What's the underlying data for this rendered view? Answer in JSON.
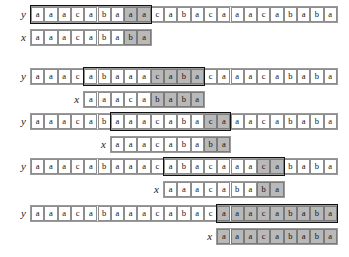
{
  "figure": {
    "kind": "string-matching-alignment-trace",
    "text_label": "y",
    "pattern_label": "x",
    "text": "aaacabaaacabacaaacababa",
    "pattern": "aaacababa",
    "text_length": 23,
    "pattern_length": 9,
    "cell_width_px": 13.3,
    "colors": {
      "shade": "#b9b9b9",
      "cell_border": "#8d8d8d",
      "window_border": "#111111",
      "strip_border": "#9a9a9a",
      "text": "#111111",
      "background": "#ffffff"
    }
  },
  "steps": [
    {
      "id": "step-1",
      "top": 6,
      "text_row": {
        "label": "y",
        "chars": [
          "a",
          "a",
          "a",
          "c",
          "a",
          "b",
          "a",
          "a",
          "a",
          "c",
          "a",
          "b",
          "a",
          "c",
          "a",
          "a",
          "a",
          "c",
          "a",
          "b",
          "a",
          "b",
          "a"
        ],
        "offset": 0,
        "shaded_indices": [
          7,
          8
        ],
        "window_start": 0,
        "window_length": 9
      },
      "pattern_row": {
        "label": "x",
        "chars": [
          "a",
          "a",
          "a",
          "c",
          "a",
          "b",
          "a",
          "b",
          "a"
        ],
        "offset": 0,
        "shaded_indices": [
          7,
          8
        ]
      }
    },
    {
      "id": "step-2",
      "top": 68,
      "text_row": {
        "label": "y",
        "chars": [
          "a",
          "a",
          "a",
          "c",
          "a",
          "b",
          "a",
          "a",
          "a",
          "c",
          "a",
          "b",
          "a",
          "c",
          "a",
          "a",
          "a",
          "c",
          "a",
          "b",
          "a",
          "b",
          "a"
        ],
        "offset": 0,
        "shaded_indices": [
          9,
          10,
          11,
          12
        ],
        "window_start": 4,
        "window_length": 9
      },
      "pattern_row": {
        "label": "x",
        "chars": [
          "a",
          "a",
          "a",
          "c",
          "a",
          "b",
          "a",
          "b",
          "a"
        ],
        "offset": 4,
        "shaded_indices": [
          5,
          6,
          7,
          8
        ]
      }
    },
    {
      "id": "step-3",
      "top": 113,
      "text_row": {
        "label": "y",
        "chars": [
          "a",
          "a",
          "a",
          "c",
          "a",
          "b",
          "a",
          "a",
          "a",
          "c",
          "a",
          "b",
          "a",
          "c",
          "a",
          "a",
          "a",
          "c",
          "a",
          "b",
          "a",
          "b",
          "a"
        ],
        "offset": 0,
        "shaded_indices": [
          13,
          14
        ],
        "window_start": 6,
        "window_length": 9
      },
      "pattern_row": {
        "label": "x",
        "chars": [
          "a",
          "a",
          "a",
          "c",
          "a",
          "b",
          "a",
          "b",
          "a"
        ],
        "offset": 6,
        "shaded_indices": [
          7,
          8
        ]
      }
    },
    {
      "id": "step-4",
      "top": 158,
      "text_row": {
        "label": "y",
        "chars": [
          "a",
          "a",
          "a",
          "c",
          "a",
          "b",
          "a",
          "a",
          "a",
          "c",
          "a",
          "b",
          "a",
          "c",
          "a",
          "a",
          "a",
          "c",
          "a",
          "b",
          "a",
          "b",
          "a"
        ],
        "offset": 0,
        "shaded_indices": [
          17,
          18
        ],
        "window_start": 10,
        "window_length": 9
      },
      "pattern_row": {
        "label": "x",
        "chars": [
          "a",
          "a",
          "a",
          "c",
          "a",
          "b",
          "a",
          "b",
          "a"
        ],
        "offset": 10,
        "shaded_indices": [
          7,
          8
        ]
      }
    },
    {
      "id": "step-5",
      "top": 205,
      "text_row": {
        "label": "y",
        "chars": [
          "a",
          "a",
          "a",
          "c",
          "a",
          "b",
          "a",
          "a",
          "a",
          "c",
          "a",
          "b",
          "a",
          "c",
          "a",
          "a",
          "a",
          "c",
          "a",
          "b",
          "a",
          "b",
          "a"
        ],
        "offset": 0,
        "shaded_indices": [
          14,
          15,
          16,
          17,
          18,
          19,
          20,
          21,
          22
        ],
        "window_start": 14,
        "window_length": 9
      },
      "pattern_row": {
        "label": "x",
        "chars": [
          "a",
          "a",
          "a",
          "c",
          "a",
          "b",
          "a",
          "b",
          "a"
        ],
        "offset": 14,
        "shaded_indices": [
          0,
          1,
          2,
          3,
          4,
          5,
          6,
          7,
          8
        ]
      }
    }
  ]
}
